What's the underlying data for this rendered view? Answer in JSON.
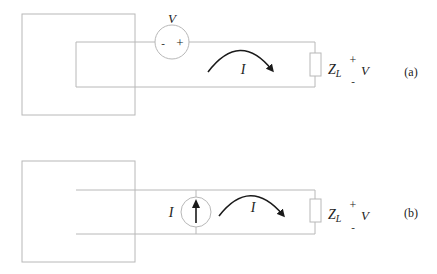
{
  "diagram": {
    "type": "circuit",
    "colors": {
      "wire": "#b8b8b8",
      "arrow": "#1a1a1a",
      "text": "#222222"
    },
    "panel_a": {
      "caption": "(a)",
      "source": {
        "kind": "voltage-source",
        "label": "V",
        "minus": "-",
        "plus": "+"
      },
      "current_label": "I",
      "load": {
        "label_main": "Z",
        "label_sub": "L",
        "plus": "+",
        "minus": "-",
        "voltage": "V"
      }
    },
    "panel_b": {
      "caption": "(b)",
      "source": {
        "kind": "current-source",
        "label": "I"
      },
      "current_label": "I",
      "load": {
        "label_main": "Z",
        "label_sub": "L",
        "plus": "+",
        "minus": "-",
        "voltage": "V"
      }
    }
  }
}
